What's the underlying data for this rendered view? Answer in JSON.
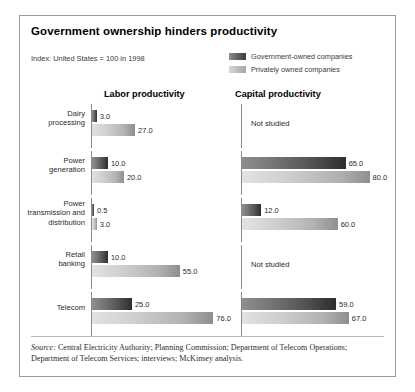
{
  "title": "Government ownership hinders productivity",
  "index_note": "Index: United States = 100 in 1998",
  "legend": [
    {
      "key": "gov",
      "label": "Government-owned companies"
    },
    {
      "key": "priv",
      "label": "Privately owned companies"
    }
  ],
  "columns": [
    {
      "key": "labor",
      "label": "Labor productivity"
    },
    {
      "key": "capital",
      "label": "Capital productivity"
    }
  ],
  "not_studied_text": "Not studied",
  "source": {
    "prefix": "Source:",
    "text": " Central Electricity Authority; Planning Commission; Department of Telecom Operations; Department of Telecom Services; interviews; McKinsey analysis."
  },
  "chart_data": {
    "type": "bar",
    "title": "Government ownership hinders productivity",
    "subtitle": "Index: United States = 100 in 1998",
    "orientation": "horizontal",
    "xlabel": "",
    "ylabel": "",
    "xlim": [
      0,
      100
    ],
    "grid": false,
    "legend_position": "top-right",
    "legend_entries": [
      "Government-owned companies",
      "Privately owned companies"
    ],
    "panels": [
      "Labor productivity",
      "Capital productivity"
    ],
    "categories": [
      "Dairy processing",
      "Power generation",
      "Power transmission and distribution",
      "Retail banking",
      "Telecom"
    ],
    "series": [
      {
        "name": "Government-owned companies",
        "panel": "Labor productivity",
        "values": [
          3.0,
          10.0,
          0.5,
          10.0,
          25.0
        ]
      },
      {
        "name": "Privately owned companies",
        "panel": "Labor productivity",
        "values": [
          27.0,
          20.0,
          3.0,
          55.0,
          76.0
        ]
      },
      {
        "name": "Government-owned companies",
        "panel": "Capital productivity",
        "values": [
          null,
          65.0,
          12.0,
          null,
          59.0
        ]
      },
      {
        "name": "Privately owned companies",
        "panel": "Capital productivity",
        "values": [
          null,
          80.0,
          60.0,
          null,
          67.0
        ]
      }
    ],
    "notes": [
      "Dairy processing capital productivity: Not studied",
      "Retail banking capital productivity: Not studied"
    ]
  },
  "rows": [
    {
      "label_lines": [
        "Dairy",
        "processing"
      ],
      "labor": {
        "studied": true,
        "gov": "3.0",
        "priv": "27.0",
        "gov_val": 3.0,
        "priv_val": 27.0
      },
      "capital": {
        "studied": false,
        "gov": "",
        "priv": "",
        "gov_val": 0,
        "priv_val": 0
      }
    },
    {
      "label_lines": [
        "Power",
        "generation"
      ],
      "labor": {
        "studied": true,
        "gov": "10.0",
        "priv": "20.0",
        "gov_val": 10.0,
        "priv_val": 20.0
      },
      "capital": {
        "studied": true,
        "gov": "65.0",
        "priv": "80.0",
        "gov_val": 65.0,
        "priv_val": 80.0
      }
    },
    {
      "label_lines": [
        "Power",
        "transmission and",
        "distribution"
      ],
      "labor": {
        "studied": true,
        "gov": "0.5",
        "priv": "3.0",
        "gov_val": 0.5,
        "priv_val": 3.0
      },
      "capital": {
        "studied": true,
        "gov": "12.0",
        "priv": "60.0",
        "gov_val": 12.0,
        "priv_val": 60.0
      }
    },
    {
      "label_lines": [
        "Retail",
        "banking"
      ],
      "labor": {
        "studied": true,
        "gov": "10.0",
        "priv": "55.0",
        "gov_val": 10.0,
        "priv_val": 55.0
      },
      "capital": {
        "studied": false,
        "gov": "",
        "priv": "",
        "gov_val": 0,
        "priv_val": 0
      }
    },
    {
      "label_lines": [
        "Telecom"
      ],
      "labor": {
        "studied": true,
        "gov": "25.0",
        "priv": "76.0",
        "gov_val": 25.0,
        "priv_val": 76.0
      },
      "capital": {
        "studied": true,
        "gov": "59.0",
        "priv": "67.0",
        "gov_val": 59.0,
        "priv_val": 67.0
      }
    }
  ],
  "scale_px_per_unit": 1.595
}
